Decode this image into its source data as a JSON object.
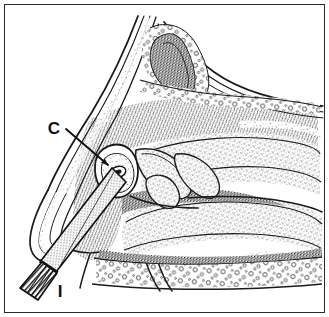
{
  "figure": {
    "domain": "anatomical-line-drawing",
    "background_color": "#ffffff",
    "ink_color": "#1a1a1a",
    "frame_color": "#2b2b2b",
    "width": 329,
    "height": 317
  },
  "labels": [
    {
      "id": "C",
      "text": "C",
      "role": "leader-label",
      "description": "Label C with leader line and arrowhead pointing to the ostium / uncinate region",
      "x": 54,
      "y": 128,
      "font_size": 17,
      "leader": {
        "x1": 66,
        "y1": 129,
        "x2": 108,
        "y2": 165
      },
      "arrowhead": {
        "x": 110,
        "y": 167,
        "angle": 40
      }
    },
    {
      "id": "I",
      "text": "I",
      "role": "instrument-label",
      "description": "Label I marking the endoscope instrument shaft and handle",
      "x": 60,
      "y": 297,
      "font_size": 17
    }
  ],
  "structures": [
    {
      "name": "nasal-dorsum",
      "type": "outline",
      "note": "Layered parallel curves forming the bridge and skin of the nose"
    },
    {
      "name": "frontal-sinus",
      "type": "cavity",
      "note": "Dark heavily stippled triangular cavity at top, outlined with bone cell circles"
    },
    {
      "name": "skull-base",
      "type": "outline",
      "note": "Long sweeping curves across the upper right"
    },
    {
      "name": "middle-turbinate",
      "type": "stippled-mass",
      "note": "Large stippled lobe in the mid field"
    },
    {
      "name": "inferior-turbinate",
      "type": "stippled-mass",
      "note": "Lower stippled lobe"
    },
    {
      "name": "hard-palate",
      "type": "bone",
      "note": "Lower boundary with cancellous bone cell circles"
    },
    {
      "name": "columella",
      "type": "outline",
      "note": "Nasal tip and columella at left"
    },
    {
      "name": "ostium",
      "type": "opening",
      "note": "Small oval opening targeted by label C arrow"
    },
    {
      "name": "endoscope-shaft",
      "type": "instrument",
      "note": "Diagonal tapered shaft entering the nostril"
    },
    {
      "name": "endoscope-handle",
      "type": "instrument",
      "note": "Hatched striated block at lower left, labelled I"
    }
  ]
}
